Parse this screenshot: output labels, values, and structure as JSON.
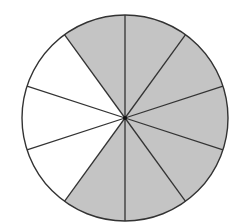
{
  "diagram": {
    "type": "fraction-circle",
    "total_sectors": 10,
    "shaded_sectors": 7,
    "unshaded_sectors": 3,
    "shaded_indices_clockwise_from_top": [
      0,
      1,
      2,
      3,
      4,
      5,
      9
    ],
    "unshaded_indices_clockwise_from_top": [
      6,
      7,
      8
    ],
    "colors": {
      "shaded": "#c4c4c4",
      "unshaded": "#ffffff",
      "stroke": "#333333"
    },
    "geometry": {
      "cx": 125,
      "cy": 118,
      "r": 103
    }
  }
}
